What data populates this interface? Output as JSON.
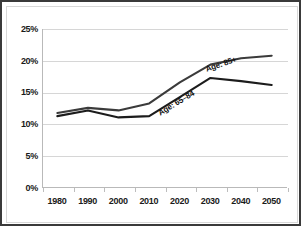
{
  "chart_data": {
    "type": "line",
    "title": "",
    "subtitle": "",
    "xlabel": "",
    "ylabel": "",
    "categories": [
      "1980",
      "1990",
      "2000",
      "2010",
      "2020",
      "2030",
      "2040",
      "2050"
    ],
    "x": [
      1980,
      1990,
      2000,
      2010,
      2020,
      2030,
      2040,
      2050
    ],
    "series": [
      {
        "name": "Age: 85+",
        "label": "Age: 85+",
        "color": "#3b3b3b",
        "values": [
          11.8,
          12.6,
          12.2,
          13.3,
          16.6,
          19.4,
          20.4,
          20.8
        ]
      },
      {
        "name": "Age: 65-84",
        "label": "Age: 65–84",
        "color": "#1c1c1c",
        "values": [
          11.3,
          12.2,
          11.1,
          11.3,
          14.3,
          17.3,
          16.8,
          16.2
        ]
      }
    ],
    "ylim": [
      0,
      25
    ],
    "yticks": [
      0,
      5,
      10,
      15,
      20,
      25
    ],
    "ytick_labels": [
      "0%",
      "5%",
      "10%",
      "15%",
      "20%",
      "25%"
    ],
    "grid": true,
    "legend": "inline-annotations",
    "legend_position": "on-plot",
    "units": "percent"
  },
  "axes": {
    "y": {
      "tick_labels": [
        "25%",
        "20%",
        "15%",
        "10%",
        "5%",
        "0%"
      ]
    },
    "x": {
      "tick_labels": [
        "1980",
        "1990",
        "2000",
        "2010",
        "2020",
        "2030",
        "2040",
        "2050"
      ]
    }
  },
  "colors": {
    "border": "#3a3a3a",
    "inner_border": "#d8d8d8",
    "gridline": "#d6d6d6",
    "axis": "#b9b9b9",
    "series_upper": "#3b3b3b",
    "series_lower": "#1c1c1c",
    "text": "#1a1a1a",
    "background": "#ffffff"
  }
}
